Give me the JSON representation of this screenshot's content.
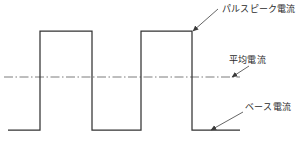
{
  "diagram": {
    "type": "line",
    "background_color": "#ffffff",
    "stroke_color": "#333333",
    "centerline_color": "#6d6d6d",
    "leader_color": "#4a4a4a",
    "text_color": "#2b2b2b"
  },
  "labels": {
    "peak": "パルスピーク電流",
    "average": "平均電流",
    "base": "ベース電流"
  },
  "chart_data": {
    "type": "line",
    "title": "",
    "xlabel": "",
    "ylabel": "",
    "grid": false,
    "legend": "none",
    "xlim": [
      0,
      303
    ],
    "ylim": [
      0,
      141
    ],
    "levels": {
      "pulse_peak_y": 31,
      "average_y": 77,
      "base_y": 130
    },
    "series": [
      {
        "name": "pulse-current",
        "points": [
          [
            8,
            130
          ],
          [
            40,
            130
          ],
          [
            40,
            31
          ],
          [
            92,
            31
          ],
          [
            92,
            130
          ],
          [
            141,
            130
          ],
          [
            141,
            31
          ],
          [
            192,
            31
          ],
          [
            192,
            130
          ],
          [
            240,
            130
          ]
        ]
      },
      {
        "name": "average-current-line",
        "style": "dash-dot",
        "points": [
          [
            4,
            77
          ],
          [
            240,
            77
          ]
        ]
      }
    ],
    "annotations": [
      {
        "name": "pulse-peak-annotation",
        "text": "パルスピーク電流",
        "text_x": 222,
        "text_y": 12,
        "leader": [
          [
            218,
            9
          ],
          [
            193,
            31
          ]
        ],
        "arrow_at": [
          193,
          31
        ]
      },
      {
        "name": "average-current-annotation",
        "text": "平均電流",
        "text_x": 229,
        "text_y": 63,
        "leader": [
          [
            249,
            66
          ],
          [
            232,
            77
          ]
        ],
        "arrow_at": [
          232,
          77
        ]
      },
      {
        "name": "base-current-annotation",
        "text": "ベース電流",
        "text_x": 245,
        "text_y": 110,
        "leader": [
          [
            243,
            112
          ],
          [
            211,
            130
          ]
        ],
        "arrow_at": [
          211,
          130
        ]
      }
    ]
  }
}
